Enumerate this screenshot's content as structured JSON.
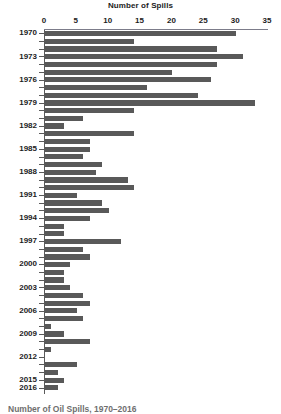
{
  "chart_data": {
    "type": "bar",
    "orientation": "horizontal",
    "title": "Number of Spills",
    "xlabel": "",
    "ylabel": "",
    "xlim": [
      0,
      35
    ],
    "xticks": [
      0,
      5,
      10,
      15,
      20,
      25,
      30,
      35
    ],
    "grid": false,
    "legend": null,
    "bar_color": "#595959",
    "axis_color": "#5a5a5a",
    "background": "#ffffff",
    "categories": [
      "1970",
      "1971",
      "1972",
      "1973",
      "1974",
      "1975",
      "1976",
      "1977",
      "1978",
      "1979",
      "1980",
      "1981",
      "1982",
      "1983",
      "1984",
      "1985",
      "1986",
      "1987",
      "1988",
      "1989",
      "1990",
      "1991",
      "1992",
      "1993",
      "1994",
      "1995",
      "1996",
      "1997",
      "1998",
      "1999",
      "2000",
      "2001",
      "2002",
      "2003",
      "2004",
      "2005",
      "2006",
      "2007",
      "2008",
      "2009",
      "2010",
      "2011",
      "2012",
      "2013",
      "2014",
      "2015",
      "2016"
    ],
    "values": [
      30,
      14,
      27,
      31,
      27,
      20,
      26,
      16,
      24,
      33,
      14,
      6,
      3,
      14,
      7,
      7,
      6,
      9,
      8,
      13,
      14,
      5,
      9,
      10,
      7,
      3,
      3,
      12,
      6,
      7,
      4,
      3,
      3,
      4,
      6,
      7,
      5,
      6,
      1,
      3,
      7,
      1,
      0,
      5,
      2,
      3,
      2
    ],
    "visible_ytick_labels": [
      "1970",
      "1973",
      "1976",
      "1979",
      "1982",
      "1985",
      "1988",
      "1991",
      "1994",
      "1997",
      "2000",
      "2003",
      "2006",
      "2009",
      "2012",
      "2015",
      "2016"
    ]
  },
  "caption": {
    "text": "Number of Oil Spills, 1970–2016"
  }
}
